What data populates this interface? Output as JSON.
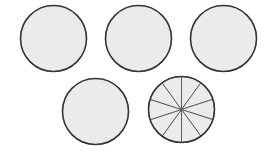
{
  "figure": {
    "canvas": {
      "width": 270,
      "height": 153
    },
    "background_color": "#ffffff"
  },
  "style": {
    "fill_color": "#ebebeb",
    "stroke_color": "#333333",
    "divider_color": "#555555",
    "outline_width": 1.6,
    "divider_width": 0.9
  },
  "chart_data": {
    "type": "pie",
    "xlabel": "",
    "ylabel": "",
    "grid": false,
    "legend": "none",
    "shapes": [
      {
        "name": "circle-1",
        "label": "whole circle 1",
        "cx": 53.5,
        "cy": 38.5,
        "r": 33.0,
        "segments": 1,
        "row": "top",
        "position": 1
      },
      {
        "name": "circle-2",
        "label": "whole circle 2",
        "cx": 138.5,
        "cy": 38.5,
        "r": 33.0,
        "segments": 1,
        "row": "top",
        "position": 2
      },
      {
        "name": "circle-3",
        "label": "whole circle 3",
        "cx": 223.5,
        "cy": 38.5,
        "r": 33.0,
        "segments": 1,
        "row": "top",
        "position": 3
      },
      {
        "name": "circle-4",
        "label": "whole circle 4",
        "cx": 95.5,
        "cy": 111.5,
        "r": 33.0,
        "segments": 1,
        "row": "bottom",
        "position": 1
      },
      {
        "name": "circle-5",
        "label": "circle divided into ten equal sectors",
        "cx": 181.5,
        "cy": 109.5,
        "r": 33.0,
        "segments": 10,
        "start_angle_deg": -90,
        "sector_angle_deg": 36,
        "row": "bottom",
        "position": 2
      }
    ],
    "categories": [
      "circle-1",
      "circle-2",
      "circle-3",
      "circle-4",
      "circle-5"
    ],
    "values": [
      1,
      1,
      1,
      1,
      1
    ],
    "divided_circle_slices": [
      {
        "index": 1,
        "value": 0.1,
        "angle_deg": 36
      },
      {
        "index": 2,
        "value": 0.1,
        "angle_deg": 36
      },
      {
        "index": 3,
        "value": 0.1,
        "angle_deg": 36
      },
      {
        "index": 4,
        "value": 0.1,
        "angle_deg": 36
      },
      {
        "index": 5,
        "value": 0.1,
        "angle_deg": 36
      },
      {
        "index": 6,
        "value": 0.1,
        "angle_deg": 36
      },
      {
        "index": 7,
        "value": 0.1,
        "angle_deg": 36
      },
      {
        "index": 8,
        "value": 0.1,
        "angle_deg": 36
      },
      {
        "index": 9,
        "value": 0.1,
        "angle_deg": 36
      },
      {
        "index": 10,
        "value": 0.1,
        "angle_deg": 36
      }
    ]
  }
}
